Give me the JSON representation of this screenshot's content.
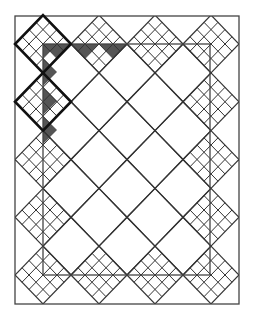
{
  "diagram": {
    "width": 255,
    "height": 325,
    "outer_rect": {
      "x": 15,
      "y": 16,
      "w": 224,
      "h": 288
    },
    "inner_rect": {
      "x": 43,
      "y": 44,
      "w": 167,
      "h": 231
    },
    "grid": {
      "cols": 4,
      "rows": 5,
      "x0": 43,
      "dx": 56,
      "y0": 44,
      "dy": 57.75,
      "half_x": 28,
      "half_y": 28.9
    },
    "highlighted_blocks": [
      {
        "col": 0,
        "row": 0
      },
      {
        "col": 0,
        "row": 1
      }
    ],
    "colors": {
      "line": "#333333",
      "bold": "#111111",
      "fill": "#555555",
      "bg": "#ffffff"
    }
  }
}
